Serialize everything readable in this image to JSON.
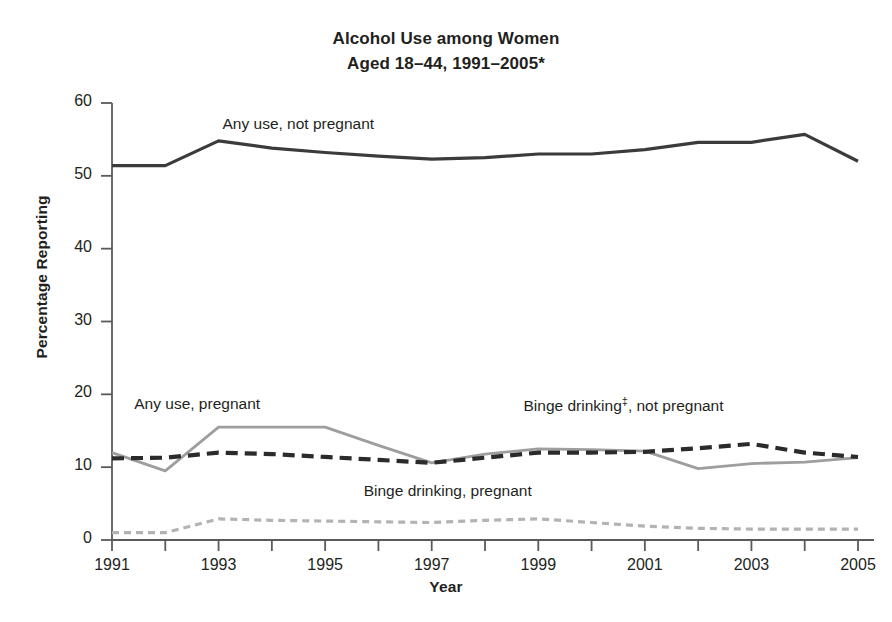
{
  "chart_data": {
    "type": "line",
    "title": "Alcohol Use among Women Aged 18–44, 1991–2005*",
    "title_line1": "Alcohol Use among Women",
    "title_line2": "Aged 18–44, 1991–2005*",
    "xlabel": "Year",
    "ylabel": "Percentage Reporting",
    "grid": false,
    "legend_position": "inline-annotations",
    "xlim": [
      1991,
      2005
    ],
    "ylim": [
      0,
      60
    ],
    "yticks": [
      0,
      10,
      20,
      30,
      40,
      50,
      60
    ],
    "ytick_labels": [
      "0",
      "10",
      "20",
      "30",
      "40",
      "50",
      "60"
    ],
    "x": [
      1991,
      1992,
      1993,
      1994,
      1995,
      1996,
      1997,
      1998,
      1999,
      2000,
      2001,
      2002,
      2003,
      2004,
      2005
    ],
    "xticks": [
      1991,
      1992,
      1993,
      1994,
      1995,
      1996,
      1997,
      1998,
      1999,
      2000,
      2001,
      2002,
      2003,
      2004,
      2005
    ],
    "xtick_labels_shown": [
      "1991",
      "1993",
      "1995",
      "1997",
      "1999",
      "2001",
      "2003",
      "2005"
    ],
    "series": [
      {
        "name": "Any use, not pregnant",
        "label": "Any use, not pregnant",
        "style": "solid",
        "color": "#3b3b3b",
        "width": 3.2,
        "values": [
          51.4,
          51.4,
          54.8,
          53.8,
          53.2,
          52.7,
          52.3,
          52.5,
          53.0,
          53.0,
          53.6,
          54.6,
          54.6,
          55.7,
          52.0
        ]
      },
      {
        "name": "Any use, pregnant",
        "label": "Any use, pregnant",
        "style": "solid",
        "color": "#9e9e9e",
        "width": 2.8,
        "values": [
          12.0,
          9.5,
          15.5,
          15.5,
          15.5,
          13.0,
          10.6,
          11.8,
          12.5,
          12.4,
          12.2,
          9.8,
          10.5,
          10.7,
          11.3
        ]
      },
      {
        "name": "Binge drinking, not pregnant",
        "label": "Binge drinking‡, not pregnant",
        "style": "dashed",
        "color": "#2b2b2b",
        "width": 4.2,
        "values": [
          11.2,
          11.3,
          12.0,
          11.8,
          11.4,
          11.0,
          10.6,
          11.3,
          12.0,
          12.0,
          12.1,
          12.6,
          13.2,
          12.0,
          11.4
        ]
      },
      {
        "name": "Binge drinking, pregnant",
        "label": "Binge drinking, pregnant",
        "style": "dashed",
        "color": "#b3b3b3",
        "width": 3.2,
        "values": [
          1.0,
          1.0,
          2.9,
          2.7,
          2.6,
          2.5,
          2.4,
          2.7,
          2.9,
          2.4,
          1.9,
          1.6,
          1.5,
          1.5,
          1.5
        ]
      }
    ],
    "annotations": [
      {
        "text": "Any use, not pregnant",
        "x": 1994.5,
        "y": 57.0
      },
      {
        "text": "Any use, pregnant",
        "x": 1992.6,
        "y": 18.5
      },
      {
        "text": "Binge drinking‡, not pregnant",
        "x": 2000.6,
        "y": 18.6
      },
      {
        "text": "Binge drinking, pregnant",
        "x": 1997.3,
        "y": 6.6
      }
    ],
    "footnote_markers": [
      "*",
      "‡"
    ]
  }
}
